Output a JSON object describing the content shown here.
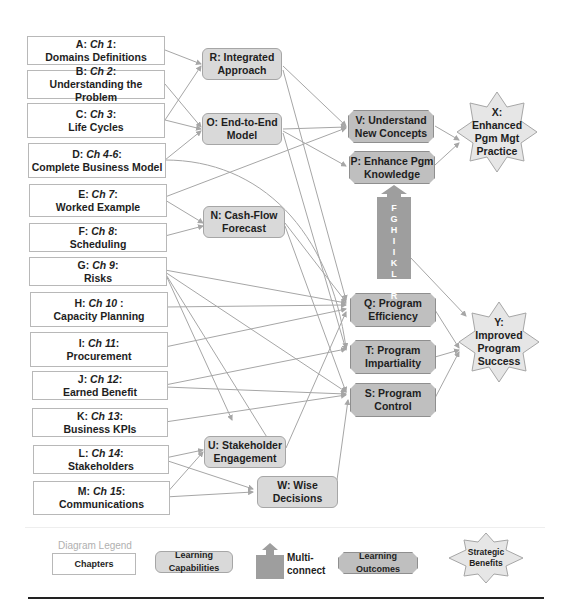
{
  "chapters": [
    {
      "letter": "A:",
      "ch": "Ch 1",
      "title": "Domains Definitions"
    },
    {
      "letter": "B:",
      "ch": "Ch 2",
      "title": "Understanding the Problem"
    },
    {
      "letter": "C:",
      "ch": "Ch 3",
      "title": "Life Cycles"
    },
    {
      "letter": "D:",
      "ch": "Ch 4-6",
      "title": "Complete Business Model"
    },
    {
      "letter": "E:",
      "ch": "Ch 7",
      "title": "Worked Example"
    },
    {
      "letter": "F:",
      "ch": "Ch 8",
      "title": "Scheduling"
    },
    {
      "letter": "G:",
      "ch": "Ch 9",
      "title": "Risks"
    },
    {
      "letter": "H:",
      "ch": "Ch 10",
      "title": "Capacity Planning"
    },
    {
      "letter": "I:",
      "ch": "Ch 11",
      "title": "Procurement"
    },
    {
      "letter": "J:",
      "ch": "Ch 12",
      "title": "Earned Benefit"
    },
    {
      "letter": "K:",
      "ch": "Ch 13",
      "title": "Business KPIs"
    },
    {
      "letter": "L:",
      "ch": "Ch 14",
      "title": "Stakeholders"
    },
    {
      "letter": "M:",
      "ch": "Ch 15",
      "title": "Communications"
    }
  ],
  "capabilities": {
    "R": {
      "line1": "R: Integrated",
      "line2": "Approach"
    },
    "O": {
      "line1": "O: End-to-End",
      "line2": "Model"
    },
    "N": {
      "line1": "N: Cash-Flow",
      "line2": "Forecast"
    },
    "U": {
      "line1": "U: Stakeholder",
      "line2": "Engagement"
    },
    "W": {
      "line1": "W: Wise",
      "line2": "Decisions"
    }
  },
  "outcomes": {
    "V": {
      "line1": "V: Understand",
      "line2": "New Concepts"
    },
    "P": {
      "line1": "P: Enhance Pgm",
      "line2": "Knowledge"
    },
    "Q": {
      "line1": "Q: Program",
      "line2": "Efficiency"
    },
    "T": {
      "line1": "T: Program",
      "line2": "Impartiality"
    },
    "S": {
      "line1": "S: Program",
      "line2": "Control"
    }
  },
  "benefits": {
    "X": {
      "lines": [
        "X:",
        "Enhanced",
        "Pgm Mgt",
        "Practice"
      ]
    },
    "Y": {
      "lines": [
        "Y:",
        "Improved",
        "Program",
        "Success"
      ]
    }
  },
  "multiconnect": {
    "letters": [
      "F",
      "G",
      "H",
      "I",
      "I",
      "K",
      "L",
      "M",
      "R"
    ]
  },
  "legend": {
    "title": "Diagram Legend",
    "chapters": "Chapters",
    "capabilities": "Learning Capabilities",
    "multi_line1": "Multi-",
    "multi_line2": "connect",
    "outcomes": "Learning Outcomes",
    "benefits_line1": "Strategic",
    "benefits_line2": "Benefits"
  },
  "colors": {
    "chapter_fill": "#ffffff",
    "capability_fill": "#d9d9d9",
    "outcome_fill": "#bfbfbf",
    "benefit_fill": "#e6e6e6",
    "multiconnect_fill": "#9e9e9e",
    "connector": "#a6a6a6"
  }
}
